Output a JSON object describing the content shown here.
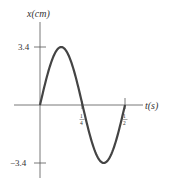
{
  "chart_data": {
    "type": "line",
    "title": "",
    "xlabel": "t(s)",
    "ylabel": "x(cm)",
    "x_ticks": [
      {
        "value": 0.25,
        "label_num": "1",
        "label_den": "4"
      },
      {
        "value": 0.5,
        "label_num": "1",
        "label_den": "2"
      }
    ],
    "y_ticks": [
      {
        "value": 3.4,
        "label": "3.4"
      },
      {
        "value": -3.4,
        "label": "−3.4"
      }
    ],
    "series": [
      {
        "name": "x(t) = 3.4 sin(4πt)",
        "amplitude": 3.4,
        "period": 0.5,
        "x": [
          0,
          0.0625,
          0.125,
          0.1875,
          0.25,
          0.3125,
          0.375,
          0.4375,
          0.5
        ],
        "values": [
          0,
          2.4,
          3.4,
          2.4,
          0,
          -2.4,
          -3.4,
          -2.4,
          0
        ]
      }
    ],
    "xlim": [
      0,
      0.5
    ],
    "ylim": [
      -3.4,
      3.4
    ],
    "grid": false,
    "legend": "none",
    "color": "#444444"
  }
}
